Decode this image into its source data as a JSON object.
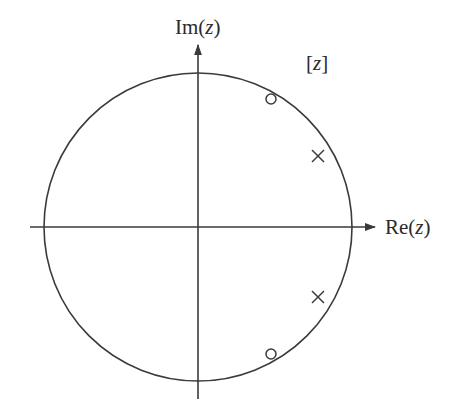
{
  "diagram": {
    "type": "pole-zero plot",
    "plane_label": "[z]",
    "axes": {
      "real": {
        "label_prefix": "Re(",
        "label_var": "z",
        "label_suffix": ")"
      },
      "imag": {
        "label_prefix": "Im(",
        "label_var": "z",
        "label_suffix": ")"
      }
    },
    "unit_circle": {
      "center": [
        198,
        227
      ],
      "radius": 154
    },
    "zeros": [
      {
        "x": 271,
        "y": 99,
        "symbol": "o"
      },
      {
        "x": 271,
        "y": 354,
        "symbol": "o"
      }
    ],
    "poles": [
      {
        "x": 318,
        "y": 156,
        "symbol": "x"
      },
      {
        "x": 318,
        "y": 297,
        "symbol": "x"
      }
    ],
    "colors": {
      "line": "#3a3a3a",
      "text": "#2a2a2a",
      "background": "#ffffff"
    }
  }
}
